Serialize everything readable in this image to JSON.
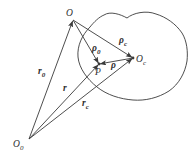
{
  "figure": {
    "width": 193,
    "height": 161,
    "background": "#ffffff",
    "stroke_color": "#3a3a3a",
    "stroke_width": 0.9,
    "label_font_size": 9.5,
    "sub_font_size": 7,
    "blob_path": "M 104 15 C 110 11 120 14 127 18 C 133 13 146 10 156 14 C 166 17 176 24 182 33 C 187 41 188 52 187 61 C 185 73 179 84 169 91 C 158 98 145 101 133 100 C 120 99 107 95 97 87 C 87 79 79 68 78 57 C 77 46 82 35 90 27 C 94 22 99 17 104 15 Z",
    "points": [
      {
        "id": "O",
        "x": 73,
        "y": 20,
        "label": "O",
        "sub": "",
        "label_x": 66,
        "label_y": 16,
        "dot": false
      },
      {
        "id": "O0",
        "x": 29,
        "y": 139,
        "label": "O",
        "sub": "0",
        "label_x": 13,
        "label_y": 147,
        "dot": false
      },
      {
        "id": "Oc",
        "x": 133,
        "y": 58,
        "label": "O",
        "sub": "c",
        "label_x": 136,
        "label_y": 62,
        "dot": true
      },
      {
        "id": "P",
        "x": 99,
        "y": 64,
        "label": "P",
        "sub": "",
        "label_x": 95,
        "label_y": 75,
        "dot": true
      }
    ],
    "vectors": [
      {
        "id": "r0",
        "from": "O0",
        "to": "O",
        "label": "r",
        "sub": "0",
        "label_x": 38,
        "label_y": 74
      },
      {
        "id": "r",
        "from": "O0",
        "to": "P",
        "label": "r",
        "sub": "",
        "label_x": 63,
        "label_y": 91
      },
      {
        "id": "rc",
        "from": "O0",
        "to": "Oc",
        "label": "r",
        "sub": "c",
        "label_x": 82,
        "label_y": 106
      },
      {
        "id": "rho0",
        "from": "O",
        "to": "P",
        "label": "ρ",
        "sub": "0",
        "label_x": 92,
        "label_y": 51
      },
      {
        "id": "rhoc",
        "from": "O",
        "to": "Oc",
        "label": "ρ",
        "sub": "c",
        "label_x": 119,
        "label_y": 43
      },
      {
        "id": "rho",
        "from": "Oc",
        "to": "P",
        "label": "ρ",
        "sub": "",
        "label_x": 111,
        "label_y": 68
      }
    ]
  }
}
